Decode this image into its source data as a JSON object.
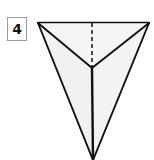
{
  "figure": {
    "number_label": "4",
    "caption": "",
    "background_color": "#ffffff"
  },
  "label_box": {
    "text": "4",
    "border_color": "#9a9a9a",
    "fill_color": "#ffffff",
    "text_color": "#111111",
    "x": 7,
    "y": 17,
    "width": 20,
    "height": 24
  },
  "diagram": {
    "type": "3d-solid-line-drawing",
    "solid_name": "tetrahedron",
    "stroke_color": "#111111",
    "stroke_width": 1.6,
    "face_fill_front_left": "#f2f1ef",
    "face_fill_front_right": "#f4f3f1",
    "face_fill_top": "#f6f5f3",
    "hidden_edge_style": "dashed",
    "hidden_edge_dash": "4 3",
    "vertices": {
      "top_left": {
        "x": 38,
        "y": 22,
        "label": "A"
      },
      "top_right": {
        "x": 149,
        "y": 22,
        "label": "B"
      },
      "top_mid": {
        "x": 92,
        "y": 22,
        "label": "M"
      },
      "center": {
        "x": 92,
        "y": 68,
        "label": "C"
      },
      "apex_bottom": {
        "x": 93,
        "y": 160,
        "label": "D"
      }
    },
    "edges": [
      {
        "name": "top-edge",
        "from": "top_left",
        "to": "top_right",
        "style": "solid"
      },
      {
        "name": "left-rib",
        "from": "top_left",
        "to": "center",
        "style": "solid"
      },
      {
        "name": "right-rib",
        "from": "top_right",
        "to": "center",
        "style": "solid"
      },
      {
        "name": "hidden-back-rib",
        "from": "top_mid",
        "to": "center",
        "style": "dashed"
      },
      {
        "name": "center-to-apex",
        "from": "center",
        "to": "apex_bottom",
        "style": "solid"
      },
      {
        "name": "left-slant",
        "from": "top_left",
        "to": "apex_bottom",
        "style": "solid"
      },
      {
        "name": "right-slant",
        "from": "top_right",
        "to": "apex_bottom",
        "style": "solid"
      }
    ]
  }
}
